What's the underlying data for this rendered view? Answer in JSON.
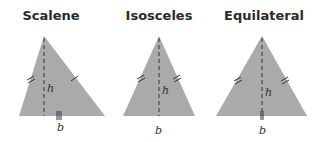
{
  "figures": [
    {
      "title": "Scalene",
      "height_label": "h",
      "base_label": "b"
    },
    {
      "title": "Isosceles",
      "height_label": "h",
      "base_label": "b"
    },
    {
      "title": "Equilateral",
      "height_label": "h",
      "base_label": "b"
    }
  ],
  "colors": {
    "fill": "#aaaaaa",
    "stroke": "#333333",
    "text": "#2a2a2a"
  }
}
